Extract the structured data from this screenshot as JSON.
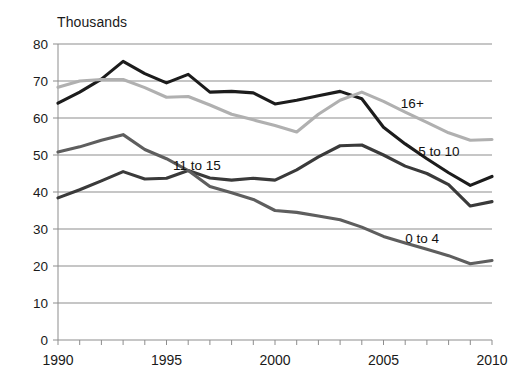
{
  "chart_data": {
    "type": "line",
    "title": "Thousands",
    "xlabel": "",
    "ylabel": "Thousands",
    "xlim": [
      1990,
      2010
    ],
    "ylim": [
      0,
      80
    ],
    "ytick_step": 10,
    "grid": true,
    "legend_position": "inline-annotations",
    "x": [
      1990,
      1991,
      1992,
      1993,
      1994,
      1995,
      1996,
      1997,
      1998,
      1999,
      2000,
      2001,
      2002,
      2003,
      2004,
      2005,
      2006,
      2007,
      2008,
      2009,
      2010
    ],
    "yticks": [
      "0",
      "10",
      "20",
      "30",
      "40",
      "50",
      "60",
      "70",
      "80"
    ],
    "xticks": [
      "1990",
      "1995",
      "2000",
      "2005",
      "2010"
    ],
    "series": [
      {
        "name": "5 to 10",
        "color": "#1c1c1c",
        "label_x": 2006.6,
        "label_y": 50.5,
        "values": [
          64.0,
          67.0,
          70.5,
          75.3,
          72.0,
          69.5,
          71.8,
          67.0,
          67.2,
          66.8,
          63.8,
          64.8,
          66.0,
          67.2,
          65.2,
          57.5,
          53.0,
          49.0,
          45.2,
          41.8,
          44.2
        ]
      },
      {
        "name": "16+",
        "color": "#b0b0b0",
        "label_x": 2005.8,
        "label_y": 63.5,
        "values": [
          68.3,
          70.0,
          70.4,
          70.4,
          68.2,
          65.6,
          65.8,
          63.5,
          61.0,
          59.5,
          58.0,
          56.2,
          61.0,
          64.8,
          67.0,
          64.5,
          61.6,
          58.8,
          56.0,
          54.0,
          54.2
        ]
      },
      {
        "name": "11 to 15",
        "color": "#3a3a3a",
        "label_x": 1995.3,
        "label_y": 46.8,
        "values": [
          38.4,
          40.6,
          43.0,
          45.5,
          43.5,
          43.7,
          45.8,
          43.8,
          43.2,
          43.7,
          43.2,
          46.0,
          49.5,
          52.5,
          52.7,
          50.0,
          47.0,
          45.0,
          42.0,
          36.2,
          37.4
        ]
      },
      {
        "name": "0 to 4",
        "color": "#5e5e5e",
        "label_x": 2006.0,
        "label_y": 27.0,
        "values": [
          50.8,
          52.2,
          54.0,
          55.5,
          51.5,
          49.0,
          45.8,
          41.5,
          39.8,
          38.0,
          35.0,
          34.5,
          33.5,
          32.5,
          30.5,
          28.0,
          26.2,
          24.5,
          22.8,
          20.6,
          21.5
        ]
      }
    ]
  }
}
